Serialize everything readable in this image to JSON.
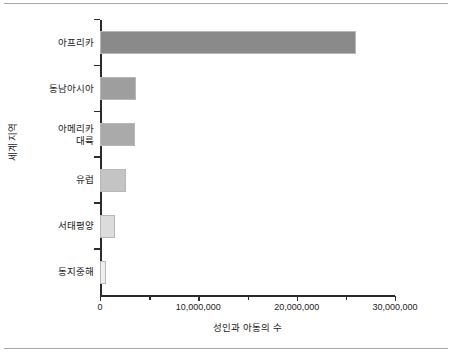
{
  "chart_data": {
    "type": "bar",
    "orientation": "horizontal",
    "title": "",
    "xlabel": "성인과 아동의 수",
    "ylabel": "세계 지역",
    "categories": [
      "아프리카",
      "동남아시아",
      "아메리카\n대륙",
      "유럽",
      "서태평양",
      "동지중해"
    ],
    "values": [
      26000000,
      3700000,
      3600000,
      2600000,
      1500000,
      600000
    ],
    "xlim": [
      0,
      30000000
    ],
    "xticks": [
      0,
      10000000,
      20000000,
      30000000
    ],
    "xticklabels": [
      "0",
      "10,000,000",
      "20,000,000",
      "30,000,000"
    ],
    "minor_xticks": [
      5000000,
      15000000,
      25000000
    ],
    "grid": false,
    "legend": "none",
    "bar_colors": [
      "#8a8a8a",
      "#9e9e9e",
      "#aaaaaa",
      "#c4c4c4",
      "#dcdcdc",
      "#eeeeee"
    ],
    "bar_edge_color": "#b7b7b7",
    "axis_color": "#2b2b2b",
    "background": "#ffffff",
    "frame_rule_color": "#a9a9a9"
  }
}
